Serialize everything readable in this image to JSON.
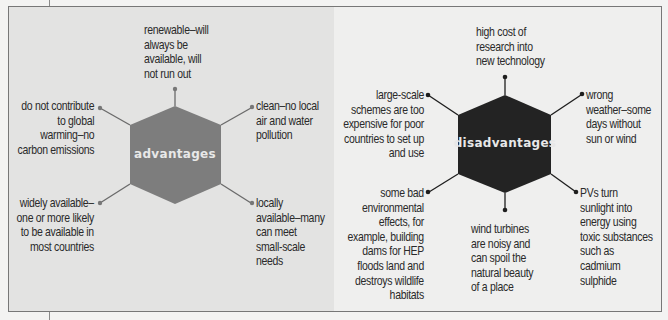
{
  "colors": {
    "advantages_hex": "#7d7d7d",
    "disadvantages_hex": "#232323",
    "connector": "#6a6a6a",
    "text": "#2a2a2a",
    "hex_text": "#e8e8e8"
  },
  "advantages": {
    "title": "advantages",
    "items": [
      "renewable–will\nalways be\navailable, will\nnot run out",
      "clean–no local\nair and water\npollution",
      "locally\navailable–many\ncan meet\nsmall-scale\nneeds",
      "widely available–\none or more likely\nto be available in\nmost countries",
      "do not contribute\nto global\nwarming–no\ncarbon emissions"
    ]
  },
  "disadvantages": {
    "title": "disadvantages",
    "items": [
      "high cost of\nresearch into\nnew technology",
      "wrong\nweather–some\ndays without\nsun or wind",
      "PVs turn\nsunlight into\nenergy using\ntoxic substances\nsuch as\ncadmium\nsulphide",
      "wind turbines\nare noisy and\ncan spoil the\nnatural beauty\nof a place",
      "some bad\nenvironmental\neffects, for\nexample, building\ndams for HEP\nfloods land and\ndestroys wildlife\nhabitats",
      "large-scale\nschemes are too\nexpensive for poor\ncountries to set up\nand use"
    ]
  }
}
